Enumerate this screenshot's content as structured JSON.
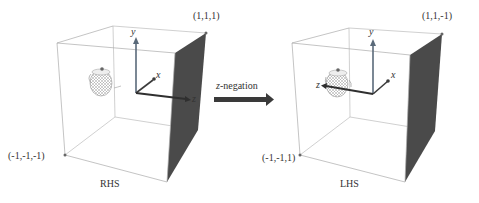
{
  "diagram": {
    "left_panel": {
      "caption": "RHS",
      "corner_top": "(1,1,1)",
      "corner_bottom": "(-1,-1,-1)",
      "axes": {
        "y": "y",
        "x": "x",
        "z": "z"
      }
    },
    "operation": {
      "var": "z",
      "label": "-negation"
    },
    "right_panel": {
      "caption": "LHS",
      "corner_top": "(1,1,-1)",
      "corner_bottom": "(-1,-1,1)",
      "axes": {
        "y": "y",
        "x": "x",
        "z": "z"
      }
    },
    "colors": {
      "edge": "#aaaaaa",
      "dark_face": "#4a4a4a",
      "axis": "#3c3c3c",
      "y_axis": "#5a6a7a",
      "arrow": "#3a3a3a"
    }
  }
}
